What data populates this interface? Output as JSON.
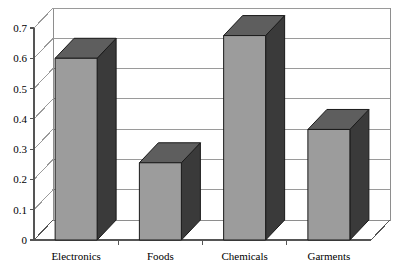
{
  "chart_data": {
    "type": "bar",
    "title": "",
    "subtitle": "",
    "xlabel": "",
    "ylabel": "",
    "categories": [
      "Electronics",
      "Foods",
      "Chemicals",
      "Garments"
    ],
    "values": [
      0.6,
      0.255,
      0.675,
      0.365
    ],
    "series": [
      {
        "name": "Series 1",
        "values": [
          0.6,
          0.255,
          0.675,
          0.365
        ]
      }
    ],
    "ylim": [
      0,
      0.7
    ],
    "ytick_labels": [
      "0",
      "0.1",
      "0.2",
      "0.3",
      "0.4",
      "0.5",
      "0.6",
      "0.7"
    ],
    "ytick_values": [
      0,
      0.1,
      0.2,
      0.3,
      0.4,
      0.5,
      0.6,
      0.7
    ],
    "grid": true,
    "grid_axis": "y",
    "legend": false,
    "legend_position": "none",
    "style": "3d-column",
    "bar_face_color": "#9c9c9c",
    "bar_top_color": "#5e5e5e",
    "bar_side_color": "#3a3a3a",
    "plot_background": "#ffffff",
    "gridline_color": "#9a9a9a",
    "axis_color": "#555555",
    "annotations": []
  },
  "axis": {
    "y_ticks": [
      {
        "label": "0.7",
        "value": 0.7
      },
      {
        "label": "0.6",
        "value": 0.6
      },
      {
        "label": "0.5",
        "value": 0.5
      },
      {
        "label": "0.4",
        "value": 0.4
      },
      {
        "label": "0.3",
        "value": 0.3
      },
      {
        "label": "0.2",
        "value": 0.2
      },
      {
        "label": "0.1",
        "value": 0.1
      },
      {
        "label": "0",
        "value": 0
      }
    ],
    "x_categories": [
      {
        "label": "Electronics"
      },
      {
        "label": "Foods"
      },
      {
        "label": "Chemicals"
      },
      {
        "label": "Garments"
      }
    ]
  }
}
